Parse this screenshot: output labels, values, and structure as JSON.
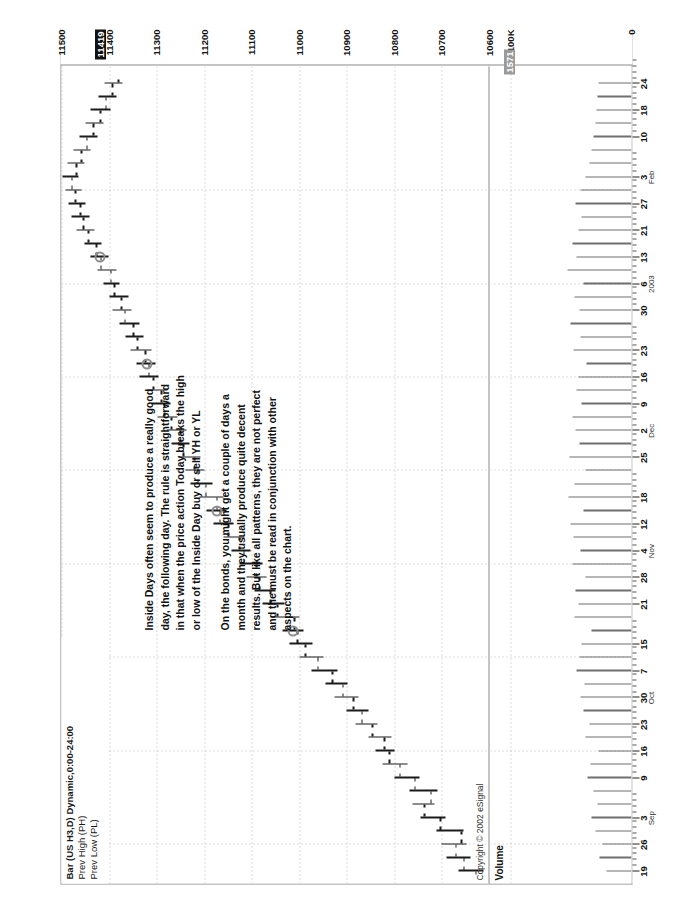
{
  "chart": {
    "title_main": "Bar (US H3,D) Dynamic,0:00-24:00",
    "title_line2": "Prev High (PH)",
    "title_line3": "Prev Low (PL)",
    "copyright": "Copyright © 2002 eSignal",
    "volume_label": "Volume"
  },
  "price_axis": {
    "ticks": [
      "11500",
      "11400",
      "11300",
      "11200",
      "11100",
      "11000",
      "10900",
      "10800",
      "10700",
      "10600"
    ],
    "highlight_value": "11419",
    "max": 11500,
    "min": 10600
  },
  "volume_axis": {
    "ticks": [
      "100K",
      "0"
    ],
    "highlight_value": "1571"
  },
  "annotation": {
    "paragraph1": [
      "Inside Days often seem to produce a really good",
      "day, the following day.  The rule is straightforward",
      "in that when the price action Today  breaks the high",
      "or low of the Inside Day buy or sell YH or YL"
    ],
    "paragraph2": [
      "On the bonds, you might get a couple of days a",
      "month and they usually produce quite decent",
      "results.  But like all patterns, they are not perfect",
      "and the must be read in conjunction with other",
      "aspects on the chart."
    ]
  },
  "date_axis": {
    "labels": [
      "19",
      "26",
      "3",
      "9",
      "16",
      "23",
      "30",
      "7",
      "15",
      "21",
      "28",
      "4",
      "12",
      "18",
      "25",
      "2",
      "9",
      "16",
      "23",
      "30",
      "6",
      "13",
      "21",
      "27",
      "3",
      "10",
      "18",
      "24"
    ],
    "months": [
      {
        "name": "Sep",
        "at_label": "3"
      },
      {
        "name": "Oct",
        "at_label": "30"
      },
      {
        "name": "Nov",
        "at_label": "4"
      },
      {
        "name": "Dec",
        "at_label": "2"
      },
      {
        "name": "2003",
        "at_label": "6"
      },
      {
        "name": "Feb",
        "at_label": "3"
      }
    ]
  },
  "chart_data": {
    "type": "bar",
    "subtype": "ohlc-candlestick-bar",
    "title": "Bar (US H3,D) Dynamic,0:00-24:00",
    "xlabel": "",
    "ylabel": "Price",
    "ylim": [
      10600,
      11500
    ],
    "vol_ylim": [
      0,
      100000
    ],
    "grid": true,
    "legend": [
      "Prev High (PH)",
      "Prev Low (PL)"
    ],
    "x_tick_labels": [
      "19",
      "26",
      "3",
      "9",
      "16",
      "23",
      "30",
      "7",
      "15",
      "21",
      "28",
      "4",
      "12",
      "18",
      "25",
      "2",
      "9",
      "16",
      "23",
      "30",
      "6",
      "13",
      "21",
      "27",
      "3",
      "10",
      "18",
      "24"
    ],
    "y_tick_labels": [
      "11500",
      "11400",
      "11300",
      "11200",
      "11100",
      "11000",
      "10900",
      "10800",
      "10700",
      "10600"
    ],
    "bars": [
      {
        "i": 0,
        "o": 10630,
        "h": 10665,
        "l": 10612,
        "c": 10655,
        "v": 21000,
        "inside": false
      },
      {
        "i": 1,
        "o": 10655,
        "h": 10690,
        "l": 10640,
        "c": 10672,
        "v": 26000,
        "inside": false
      },
      {
        "i": 2,
        "o": 10672,
        "h": 10700,
        "l": 10648,
        "c": 10660,
        "v": 24000,
        "inside": false
      },
      {
        "i": 3,
        "o": 10660,
        "h": 10712,
        "l": 10655,
        "c": 10705,
        "v": 30000,
        "inside": false
      },
      {
        "i": 4,
        "o": 10705,
        "h": 10745,
        "l": 10692,
        "c": 10738,
        "v": 33000,
        "inside": false
      },
      {
        "i": 5,
        "o": 10738,
        "h": 10762,
        "l": 10715,
        "c": 10725,
        "v": 28000,
        "inside": false
      },
      {
        "i": 6,
        "o": 10725,
        "h": 10768,
        "l": 10710,
        "c": 10758,
        "v": 31000,
        "inside": false
      },
      {
        "i": 7,
        "o": 10758,
        "h": 10800,
        "l": 10748,
        "c": 10790,
        "v": 36000,
        "inside": false
      },
      {
        "i": 8,
        "o": 10790,
        "h": 10825,
        "l": 10772,
        "c": 10812,
        "v": 34000,
        "inside": false
      },
      {
        "i": 9,
        "o": 10812,
        "h": 10840,
        "l": 10800,
        "c": 10822,
        "v": 27000,
        "inside": false
      },
      {
        "i": 10,
        "o": 10822,
        "h": 10855,
        "l": 10805,
        "c": 10848,
        "v": 38000,
        "inside": false
      },
      {
        "i": 11,
        "o": 10848,
        "h": 10882,
        "l": 10835,
        "c": 10870,
        "v": 35000,
        "inside": false
      },
      {
        "i": 12,
        "o": 10870,
        "h": 10900,
        "l": 10855,
        "c": 10888,
        "v": 40000,
        "inside": false
      },
      {
        "i": 13,
        "o": 10888,
        "h": 10925,
        "l": 10875,
        "c": 10910,
        "v": 42000,
        "inside": false
      },
      {
        "i": 14,
        "o": 10910,
        "h": 10945,
        "l": 10898,
        "c": 10932,
        "v": 39000,
        "inside": false
      },
      {
        "i": 15,
        "o": 10932,
        "h": 10975,
        "l": 10920,
        "c": 10962,
        "v": 45000,
        "inside": false
      },
      {
        "i": 16,
        "o": 10962,
        "h": 11000,
        "l": 10948,
        "c": 10988,
        "v": 43000,
        "inside": false
      },
      {
        "i": 17,
        "o": 10988,
        "h": 11020,
        "l": 10972,
        "c": 11005,
        "v": 41000,
        "inside": false
      },
      {
        "i": 18,
        "o": 11005,
        "h": 11035,
        "l": 10992,
        "c": 11012,
        "v": 33000,
        "inside": true
      },
      {
        "i": 19,
        "o": 11012,
        "h": 11060,
        "l": 11000,
        "c": 11048,
        "v": 47000,
        "inside": false
      },
      {
        "i": 20,
        "o": 11048,
        "h": 11078,
        "l": 11032,
        "c": 11062,
        "v": 44000,
        "inside": false
      },
      {
        "i": 21,
        "o": 11062,
        "h": 11095,
        "l": 11050,
        "c": 11085,
        "v": 46000,
        "inside": false
      },
      {
        "i": 22,
        "o": 11085,
        "h": 11110,
        "l": 11068,
        "c": 11092,
        "v": 38000,
        "inside": false
      },
      {
        "i": 23,
        "o": 11092,
        "h": 11125,
        "l": 11078,
        "c": 11118,
        "v": 49000,
        "inside": false
      },
      {
        "i": 24,
        "o": 11118,
        "h": 11142,
        "l": 11102,
        "c": 11128,
        "v": 42000,
        "inside": false
      },
      {
        "i": 25,
        "o": 11128,
        "h": 11160,
        "l": 11115,
        "c": 11150,
        "v": 48000,
        "inside": false
      },
      {
        "i": 26,
        "o": 11150,
        "h": 11180,
        "l": 11138,
        "c": 11168,
        "v": 50000,
        "inside": false
      },
      {
        "i": 27,
        "o": 11168,
        "h": 11195,
        "l": 11152,
        "c": 11175,
        "v": 40000,
        "inside": true
      },
      {
        "i": 28,
        "o": 11175,
        "h": 11210,
        "l": 11160,
        "c": 11198,
        "v": 52000,
        "inside": false
      },
      {
        "i": 29,
        "o": 11198,
        "h": 11228,
        "l": 11182,
        "c": 11215,
        "v": 47000,
        "inside": false
      },
      {
        "i": 30,
        "o": 11215,
        "h": 11240,
        "l": 11200,
        "c": 11222,
        "v": 38000,
        "inside": false
      },
      {
        "i": 31,
        "o": 11222,
        "h": 11255,
        "l": 11208,
        "c": 11245,
        "v": 51000,
        "inside": false
      },
      {
        "i": 32,
        "o": 11245,
        "h": 11268,
        "l": 11230,
        "c": 11252,
        "v": 43000,
        "inside": false
      },
      {
        "i": 33,
        "o": 11252,
        "h": 11280,
        "l": 11238,
        "c": 11270,
        "v": 46000,
        "inside": false
      },
      {
        "i": 34,
        "o": 11270,
        "h": 11298,
        "l": 11256,
        "c": 11285,
        "v": 49000,
        "inside": false
      },
      {
        "i": 35,
        "o": 11285,
        "h": 11310,
        "l": 11270,
        "c": 11292,
        "v": 41000,
        "inside": false
      },
      {
        "i": 36,
        "o": 11292,
        "h": 11320,
        "l": 11278,
        "c": 11308,
        "v": 45000,
        "inside": false
      },
      {
        "i": 37,
        "o": 11308,
        "h": 11335,
        "l": 11295,
        "c": 11318,
        "v": 44000,
        "inside": false
      },
      {
        "i": 38,
        "o": 11318,
        "h": 11342,
        "l": 11302,
        "c": 11325,
        "v": 37000,
        "inside": true
      },
      {
        "i": 39,
        "o": 11325,
        "h": 11355,
        "l": 11310,
        "c": 11342,
        "v": 48000,
        "inside": false
      },
      {
        "i": 40,
        "o": 11342,
        "h": 11365,
        "l": 11328,
        "c": 11350,
        "v": 42000,
        "inside": false
      },
      {
        "i": 41,
        "o": 11350,
        "h": 11378,
        "l": 11335,
        "c": 11368,
        "v": 50000,
        "inside": false
      },
      {
        "i": 42,
        "o": 11368,
        "h": 11392,
        "l": 11352,
        "c": 11375,
        "v": 43000,
        "inside": false
      },
      {
        "i": 43,
        "o": 11375,
        "h": 11400,
        "l": 11360,
        "c": 11390,
        "v": 47000,
        "inside": false
      },
      {
        "i": 44,
        "o": 11390,
        "h": 11412,
        "l": 11378,
        "c": 11398,
        "v": 40000,
        "inside": false
      },
      {
        "i": 45,
        "o": 11398,
        "h": 11425,
        "l": 11385,
        "c": 11419,
        "v": 53000,
        "inside": false
      },
      {
        "i": 46,
        "o": 11419,
        "h": 11440,
        "l": 11402,
        "c": 11428,
        "v": 45000,
        "inside": true
      },
      {
        "i": 47,
        "o": 11428,
        "h": 11452,
        "l": 11415,
        "c": 11445,
        "v": 49000,
        "inside": false
      },
      {
        "i": 48,
        "o": 11445,
        "h": 11468,
        "l": 11430,
        "c": 11455,
        "v": 44000,
        "inside": false
      },
      {
        "i": 49,
        "o": 11455,
        "h": 11478,
        "l": 11442,
        "c": 11462,
        "v": 41000,
        "inside": false
      },
      {
        "i": 50,
        "o": 11462,
        "h": 11485,
        "l": 11450,
        "c": 11472,
        "v": 46000,
        "inside": false
      },
      {
        "i": 51,
        "o": 11472,
        "h": 11492,
        "l": 11458,
        "c": 11480,
        "v": 42000,
        "inside": false
      },
      {
        "i": 52,
        "o": 11480,
        "h": 11498,
        "l": 11465,
        "c": 11470,
        "v": 38000,
        "inside": false
      },
      {
        "i": 53,
        "o": 11470,
        "h": 11488,
        "l": 11452,
        "c": 11460,
        "v": 35000,
        "inside": false
      },
      {
        "i": 54,
        "o": 11460,
        "h": 11475,
        "l": 11438,
        "c": 11448,
        "v": 33000,
        "inside": false
      },
      {
        "i": 55,
        "o": 11448,
        "h": 11462,
        "l": 11425,
        "c": 11435,
        "v": 31000,
        "inside": false
      },
      {
        "i": 56,
        "o": 11435,
        "h": 11450,
        "l": 11412,
        "c": 11420,
        "v": 30000,
        "inside": false
      },
      {
        "i": 57,
        "o": 11420,
        "h": 11438,
        "l": 11398,
        "c": 11408,
        "v": 29000,
        "inside": false
      },
      {
        "i": 58,
        "o": 11408,
        "h": 11422,
        "l": 11385,
        "c": 11395,
        "v": 28000,
        "inside": false
      },
      {
        "i": 59,
        "o": 11395,
        "h": 11410,
        "l": 11372,
        "c": 11382,
        "v": 27000,
        "inside": false
      }
    ]
  }
}
